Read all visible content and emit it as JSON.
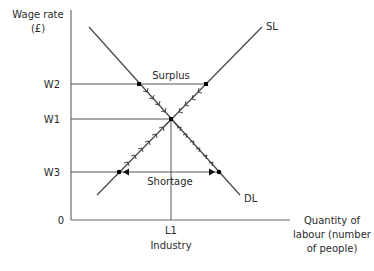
{
  "diagram": {
    "y_axis": {
      "label_line1": "Wage rate",
      "label_line2": "(£)"
    },
    "x_axis": {
      "label_line1": "Quantity of",
      "label_line2": "labour (number",
      "label_line3": "of people)",
      "origin": "0",
      "tick_label": "L1",
      "caption": "Industry"
    },
    "wage_levels": [
      {
        "label": "W2",
        "note": "above equilibrium"
      },
      {
        "label": "W1",
        "note": "equilibrium"
      },
      {
        "label": "W3",
        "note": "below equilibrium"
      }
    ],
    "curves": {
      "supply": {
        "label": "SL"
      },
      "demand": {
        "label": "DL"
      }
    },
    "annotations": {
      "surplus": "Surplus",
      "shortage": "Shortage"
    },
    "colors": {
      "axis": "#6a6a6a",
      "curve": "#4a4a4a",
      "text": "#2a2a2a",
      "point": "#000000"
    }
  }
}
